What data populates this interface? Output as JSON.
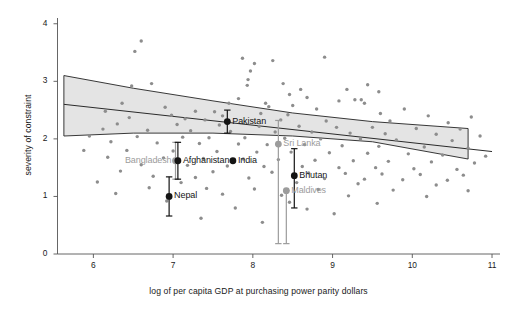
{
  "chart_data": {
    "type": "scatter",
    "title": "",
    "subtitle": "",
    "xlabel": "log of per capita GDP at purchasing power parity dollars",
    "ylabel": "severity of constraint",
    "xlim": [
      5.55,
      11.1
    ],
    "ylim": [
      0,
      4.1
    ],
    "xticks": [
      6,
      7,
      8,
      9,
      10,
      11
    ],
    "yticks": [
      0,
      1,
      2,
      3,
      4
    ],
    "grid": false,
    "legend": null,
    "legend_position": "none",
    "colors": {
      "scatter_point": "#8d8d8d",
      "highlight_point": "#141414",
      "secondary_point": "#9c9c9c",
      "fit_line": "#2a2a2a",
      "confidence_band_fill": "#e4e4e4",
      "confidence_band_edge": "#222222",
      "axis": "#555555",
      "text": "#1a1a1a"
    },
    "fit_line": {
      "name": "linear fit",
      "x": [
        5.63,
        11.0
      ],
      "y": [
        2.6,
        1.78
      ]
    },
    "confidence_band": {
      "name": "95% confidence interval",
      "x": [
        5.63,
        6.5,
        7.5,
        8.5,
        9.5,
        10.7
      ],
      "upper": [
        3.1,
        2.88,
        2.66,
        2.45,
        2.3,
        2.18
      ],
      "lower": [
        2.05,
        2.1,
        2.1,
        2.05,
        1.95,
        1.65
      ]
    },
    "highlighted_countries": [
      {
        "name": "Pakistan",
        "x": 7.68,
        "y": 2.3,
        "yerr_low": 2.1,
        "yerr_high": 2.5,
        "style": "dark",
        "label_side": "right"
      },
      {
        "name": "Bangladesh",
        "x": 7.03,
        "y": 1.62,
        "yerr_low": 1.3,
        "yerr_high": 1.94,
        "style": "light",
        "label_side": "left"
      },
      {
        "name": "Afghanistan",
        "x": 7.06,
        "y": 1.62,
        "yerr_low": 1.3,
        "yerr_high": 1.94,
        "style": "dark",
        "label_side": "right"
      },
      {
        "name": "India",
        "x": 7.75,
        "y": 1.62,
        "yerr_low": 1.62,
        "yerr_high": 1.62,
        "style": "dark",
        "label_side": "right"
      },
      {
        "name": "Nepal",
        "x": 6.95,
        "y": 1.0,
        "yerr_low": 0.66,
        "yerr_high": 1.34,
        "style": "dark",
        "label_side": "right"
      },
      {
        "name": "Sri Lanka",
        "x": 8.32,
        "y": 1.91,
        "yerr_low": 0.18,
        "yerr_high": 2.32,
        "style": "light",
        "label_side": "right"
      },
      {
        "name": "Bhutan",
        "x": 8.52,
        "y": 1.36,
        "yerr_low": 0.8,
        "yerr_high": 1.83,
        "style": "dark",
        "label_side": "right"
      },
      {
        "name": "Maldives",
        "x": 8.42,
        "y": 1.1,
        "yerr_low": 0.18,
        "yerr_high": 1.1,
        "style": "light",
        "label_side": "right"
      }
    ],
    "scatter_points": [
      [
        6.6,
        3.7
      ],
      [
        6.52,
        3.52
      ],
      [
        7.87,
        3.4
      ],
      [
        8.02,
        3.31
      ],
      [
        8.25,
        3.36
      ],
      [
        8.9,
        3.42
      ],
      [
        7.97,
        3.18
      ],
      [
        7.94,
        3.03
      ],
      [
        6.73,
        2.96
      ],
      [
        7.93,
        2.93
      ],
      [
        8.6,
        2.86
      ],
      [
        9.18,
        2.86
      ],
      [
        9.58,
        2.82
      ],
      [
        8.46,
        2.77
      ],
      [
        8.68,
        2.72
      ],
      [
        9.28,
        2.68
      ],
      [
        9.36,
        2.68
      ],
      [
        9.4,
        2.62
      ],
      [
        6.36,
        2.62
      ],
      [
        6.9,
        2.55
      ],
      [
        8.2,
        2.56
      ],
      [
        8.8,
        2.52
      ],
      [
        9.9,
        2.52
      ],
      [
        7.28,
        2.48
      ],
      [
        7.52,
        2.47
      ],
      [
        8.1,
        2.44
      ],
      [
        8.44,
        2.42
      ],
      [
        6.98,
        2.41
      ],
      [
        7.62,
        2.4
      ],
      [
        10.2,
        2.4
      ],
      [
        6.45,
        2.37
      ],
      [
        7.15,
        2.35
      ],
      [
        7.4,
        2.33
      ],
      [
        8.35,
        2.33
      ],
      [
        8.92,
        2.31
      ],
      [
        9.72,
        2.31
      ],
      [
        10.45,
        2.28
      ],
      [
        6.3,
        2.26
      ],
      [
        7.05,
        2.25
      ],
      [
        7.58,
        2.24
      ],
      [
        8.08,
        2.22
      ],
      [
        8.58,
        2.22
      ],
      [
        9.05,
        2.2
      ],
      [
        9.5,
        2.2
      ],
      [
        10.05,
        2.18
      ],
      [
        10.6,
        2.17
      ],
      [
        6.12,
        2.17
      ],
      [
        6.68,
        2.15
      ],
      [
        7.22,
        2.14
      ],
      [
        7.72,
        2.13
      ],
      [
        8.28,
        2.12
      ],
      [
        8.74,
        2.12
      ],
      [
        9.22,
        2.1
      ],
      [
        9.66,
        2.09
      ],
      [
        10.3,
        2.08
      ],
      [
        10.85,
        2.05
      ],
      [
        5.95,
        2.05
      ],
      [
        6.55,
        2.04
      ],
      [
        7.12,
        2.03
      ],
      [
        7.45,
        2.02
      ],
      [
        7.9,
        2.02
      ],
      [
        8.4,
        2.01
      ],
      [
        8.85,
        2.0
      ],
      [
        9.35,
        2.0
      ],
      [
        9.8,
        1.98
      ],
      [
        10.5,
        1.97
      ],
      [
        6.22,
        1.95
      ],
      [
        6.8,
        1.93
      ],
      [
        7.33,
        1.92
      ],
      [
        7.82,
        1.91
      ],
      [
        8.18,
        1.9
      ],
      [
        8.65,
        1.9
      ],
      [
        9.12,
        1.88
      ],
      [
        9.58,
        1.87
      ],
      [
        10.15,
        1.86
      ],
      [
        10.7,
        1.84
      ],
      [
        5.88,
        1.8
      ],
      [
        6.42,
        1.8
      ],
      [
        7.0,
        1.79
      ],
      [
        7.55,
        1.78
      ],
      [
        8.05,
        1.77
      ],
      [
        8.48,
        1.77
      ],
      [
        8.96,
        1.76
      ],
      [
        9.44,
        1.75
      ],
      [
        9.95,
        1.74
      ],
      [
        10.38,
        1.72
      ],
      [
        10.92,
        1.7
      ],
      [
        6.18,
        1.68
      ],
      [
        6.88,
        1.67
      ],
      [
        7.38,
        1.66
      ],
      [
        7.88,
        1.65
      ],
      [
        8.32,
        1.64
      ],
      [
        8.78,
        1.63
      ],
      [
        9.26,
        1.62
      ],
      [
        9.7,
        1.61
      ],
      [
        10.24,
        1.6
      ],
      [
        10.78,
        1.58
      ],
      [
        6.6,
        1.55
      ],
      [
        7.18,
        1.54
      ],
      [
        7.68,
        1.53
      ],
      [
        8.14,
        1.52
      ],
      [
        8.62,
        1.52
      ],
      [
        9.08,
        1.5
      ],
      [
        9.54,
        1.5
      ],
      [
        10.02,
        1.48
      ],
      [
        10.56,
        1.47
      ],
      [
        6.34,
        1.44
      ],
      [
        7.5,
        1.43
      ],
      [
        8.24,
        1.42
      ],
      [
        8.7,
        1.41
      ],
      [
        9.16,
        1.4
      ],
      [
        9.62,
        1.39
      ],
      [
        10.1,
        1.38
      ],
      [
        10.64,
        1.37
      ],
      [
        6.75,
        1.35
      ],
      [
        7.28,
        1.33
      ],
      [
        7.95,
        1.32
      ],
      [
        8.9,
        1.31
      ],
      [
        9.4,
        1.3
      ],
      [
        9.88,
        1.29
      ],
      [
        10.44,
        1.28
      ],
      [
        6.05,
        1.25
      ],
      [
        7.1,
        1.24
      ],
      [
        8.55,
        1.24
      ],
      [
        9.32,
        1.22
      ],
      [
        10.3,
        1.2
      ],
      [
        6.7,
        1.15
      ],
      [
        7.42,
        1.14
      ],
      [
        8.02,
        1.13
      ],
      [
        8.82,
        1.12
      ],
      [
        9.76,
        1.11
      ],
      [
        10.7,
        1.1
      ],
      [
        6.28,
        1.05
      ],
      [
        7.62,
        1.04
      ],
      [
        8.36,
        1.02
      ],
      [
        9.2,
        1.01
      ],
      [
        10.18,
        1.0
      ],
      [
        6.92,
        0.92
      ],
      [
        8.46,
        0.9
      ],
      [
        9.56,
        0.88
      ],
      [
        7.78,
        0.8
      ],
      [
        8.68,
        0.78
      ],
      [
        9.02,
        0.7
      ],
      [
        7.35,
        0.62
      ],
      [
        8.12,
        0.55
      ],
      [
        6.15,
        2.48
      ],
      [
        6.48,
        2.92
      ],
      [
        7.7,
        2.62
      ],
      [
        8.16,
        2.62
      ],
      [
        8.5,
        2.58
      ],
      [
        9.6,
        2.44
      ],
      [
        10.74,
        2.38
      ],
      [
        7.82,
        2.7
      ],
      [
        8.38,
        2.96
      ],
      [
        9.08,
        2.66
      ],
      [
        9.44,
        2.94
      ]
    ]
  }
}
